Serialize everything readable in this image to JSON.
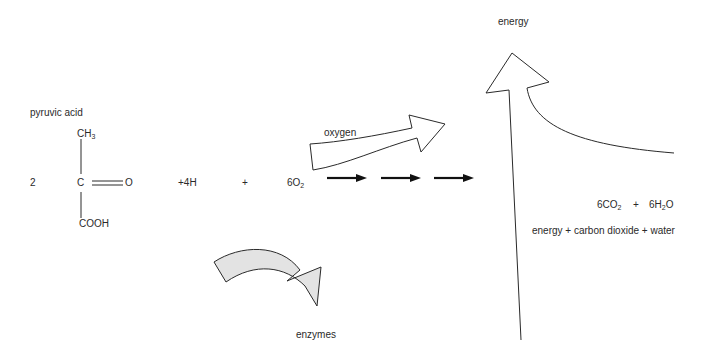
{
  "labels": {
    "pyruvic_acid": "pyruvic acid",
    "coefficient": "2",
    "ch3_main": "CH",
    "ch3_sub": "3",
    "carbon": "C",
    "oxygen_atom": "O",
    "cooh": "COOH",
    "plus_4h": "+4H",
    "plus_1": "+",
    "o2_main": "6O",
    "o2_sub": "2",
    "oxygen_arrow": "oxygen",
    "energy_top": "energy",
    "co2_main": "6CO",
    "co2_sub": "2",
    "plus_2": "+",
    "h2o_main": "6H",
    "h2o_sub": "2",
    "h2o_end": "O",
    "word_equation": "energy + carbon dioxide + water",
    "enzymes": "enzymes"
  },
  "colors": {
    "line": "#2a2a2a",
    "enzyme_fill": "#e3e3e3"
  }
}
